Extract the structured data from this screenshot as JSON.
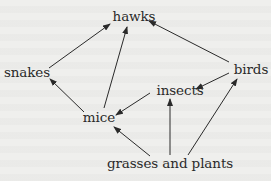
{
  "diagram": {
    "type": "food-web",
    "nodes": [
      {
        "id": "hawks",
        "label": "hawks",
        "x": 134,
        "y": 17
      },
      {
        "id": "snakes",
        "label": "snakes",
        "x": 27,
        "y": 73
      },
      {
        "id": "birds",
        "label": "birds",
        "x": 251,
        "y": 70
      },
      {
        "id": "insects",
        "label": "insects",
        "x": 180,
        "y": 91
      },
      {
        "id": "mice",
        "label": "mice",
        "x": 99,
        "y": 118
      },
      {
        "id": "plants",
        "label": "grasses and plants",
        "x": 170,
        "y": 164
      }
    ],
    "edges": [
      {
        "from": "snakes",
        "to": "hawks"
      },
      {
        "from": "mice",
        "to": "hawks"
      },
      {
        "from": "birds",
        "to": "hawks"
      },
      {
        "from": "mice",
        "to": "snakes"
      },
      {
        "from": "insects",
        "to": "mice"
      },
      {
        "from": "birds",
        "to": "insects"
      },
      {
        "from": "plants",
        "to": "mice"
      },
      {
        "from": "plants",
        "to": "insects"
      },
      {
        "from": "plants",
        "to": "birds"
      }
    ],
    "colors": {
      "line": "#2a2a2a",
      "text": "#2a2a2a",
      "background": "#efefed"
    }
  }
}
